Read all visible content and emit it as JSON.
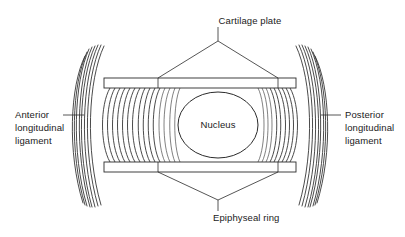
{
  "figure": {
    "background_color": "#ffffff",
    "stroke_color": "#2b2b2b",
    "text_color": "#1a1a1a",
    "width": 405,
    "height": 237
  },
  "labels": {
    "cartilage_plate": "Cartilage plate",
    "nucleus": "Nucleus",
    "epiphyseal_ring": "Epiphyseal ring",
    "anterior_ligament_line1": "Anterior",
    "anterior_ligament_line2": "longitudinal",
    "anterior_ligament_line3": "ligament",
    "posterior_ligament_line1": "Posterior",
    "posterior_ligament_line2": "longitudinal",
    "posterior_ligament_line3": "ligament"
  },
  "structures": {
    "nucleus_pulposus": "Nucleus",
    "annulus_fibrosus_left": "annulus-lamellae-left",
    "annulus_fibrosus_right": "annulus-lamellae-right",
    "cartilage_plate_top": "cartilage-plate-top",
    "cartilage_plate_bottom": "cartilage-plate-bottom",
    "anterior_longitudinal_ligament": "anterior-longitudinal-ligament",
    "posterior_longitudinal_ligament": "posterior-longitudinal-ligament"
  },
  "geometry": {
    "nucleus_center_x": 218,
    "nucleus_center_y": 125,
    "nucleus_radius_x": 40,
    "nucleus_radius_y": 33,
    "plate_top_y": 78,
    "plate_bottom_y": 172,
    "plate_left_x": 104,
    "plate_right_x": 296,
    "lamellae_count_left": 15,
    "lamellae_count_right": 9,
    "ligament_fiber_count": 8
  }
}
